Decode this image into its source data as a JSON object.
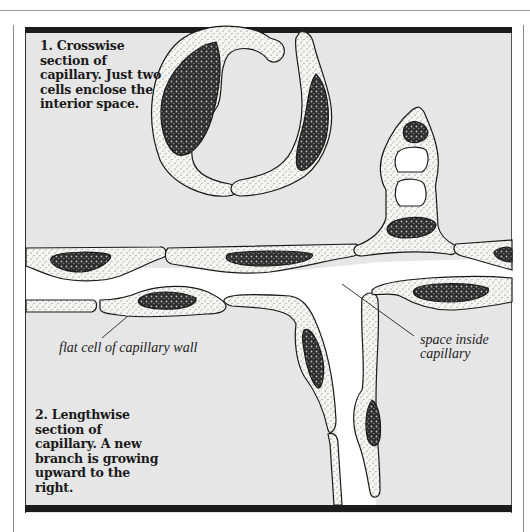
{
  "figure": {
    "captions": {
      "crosswise": "1. Crosswise section of capillary. Just two cells enclose the interior space.",
      "lengthwise": "2. Lengthwise section of capillary. A new branch is growing upward to the right."
    },
    "labels": {
      "flat_cell": "flat cell of capillary wall",
      "space_inside": "space inside capillary"
    },
    "colors": {
      "panel_background": "#e6e6e6",
      "cell_fill": "#f4f4f0",
      "nucleus_fill": "#3a3a3a",
      "lumen": "#ffffff",
      "outline": "#1a1a1a",
      "frame_bar": "#1c1c1c"
    }
  }
}
